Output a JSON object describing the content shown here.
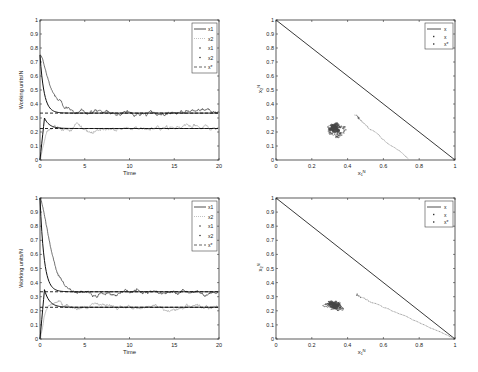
{
  "chart_data": [
    {
      "type": "line",
      "position": "top-left",
      "xlabel": "Time",
      "ylabel": "Working units/N",
      "xlim": [
        0,
        20
      ],
      "ylim": [
        0,
        1
      ],
      "xticks": [
        "0",
        "5",
        "10",
        "15",
        "20"
      ],
      "yticks": [
        "0",
        "0.1",
        "0.2",
        "0.3",
        "0.4",
        "0.5",
        "0.6",
        "0.7",
        "0.8",
        "0.9",
        "1"
      ],
      "legend": [
        "x1^N",
        "x2^N",
        "x1",
        "x2",
        "x*"
      ],
      "legend_position": "upper right",
      "series": [
        {
          "name": "x1 (deterministic)",
          "start": 0.75,
          "steady": 0.335
        },
        {
          "name": "x2 (deterministic)",
          "start": 0.0,
          "peak": 0.3,
          "steady": 0.225
        },
        {
          "name": "x* level 1",
          "value": 0.335
        },
        {
          "name": "x* level 2",
          "value": 0.225
        }
      ]
    },
    {
      "type": "scatter",
      "position": "top-right",
      "xlabel": "x1^N",
      "ylabel": "x2^N",
      "xlim": [
        0,
        1
      ],
      "ylim": [
        0,
        1
      ],
      "xticks": [
        "0",
        "0.2",
        "0.4",
        "0.6",
        "0.8",
        "1"
      ],
      "yticks": [
        "0",
        "0.1",
        "0.2",
        "0.3",
        "0.4",
        "0.5",
        "0.6",
        "0.7",
        "0.8",
        "0.9",
        "1"
      ],
      "legend": [
        "x^N",
        "x",
        "x*"
      ],
      "legend_position": "upper right",
      "boundary_line": [
        [
          0,
          1
        ],
        [
          1,
          0
        ]
      ],
      "trajectory_start": [
        0.75,
        0.0
      ],
      "cluster_center": [
        0.33,
        0.23
      ]
    },
    {
      "type": "line",
      "position": "bottom-left",
      "xlabel": "Time",
      "ylabel": "Working units/N",
      "xlim": [
        0,
        20
      ],
      "ylim": [
        0,
        1
      ],
      "xticks": [
        "0",
        "5",
        "10",
        "15",
        "20"
      ],
      "yticks": [
        "0",
        "0.1",
        "0.2",
        "0.3",
        "0.4",
        "0.5",
        "0.6",
        "0.7",
        "0.8",
        "0.9",
        "1"
      ],
      "legend": [
        "x1^N",
        "x2^N",
        "x1",
        "x2",
        "x*"
      ],
      "legend_position": "upper right",
      "series": [
        {
          "name": "x1 (deterministic)",
          "start": 1.0,
          "steady": 0.335
        },
        {
          "name": "x2 (deterministic)",
          "start": 0.0,
          "peak": 0.35,
          "steady": 0.225
        },
        {
          "name": "x* level 1",
          "value": 0.335
        },
        {
          "name": "x* level 2",
          "value": 0.225
        }
      ]
    },
    {
      "type": "scatter",
      "position": "bottom-right",
      "xlabel": "x1^N",
      "ylabel": "x2^N",
      "xlim": [
        0,
        1
      ],
      "ylim": [
        0,
        1
      ],
      "xticks": [
        "0",
        "0.2",
        "0.4",
        "0.6",
        "0.8",
        "1"
      ],
      "yticks": [
        "0",
        "0.1",
        "0.2",
        "0.3",
        "0.4",
        "0.5",
        "0.6",
        "0.7",
        "0.8",
        "0.9",
        "1"
      ],
      "legend": [
        "x^N",
        "x",
        "x*"
      ],
      "legend_position": "upper right",
      "boundary_line": [
        [
          0,
          1
        ],
        [
          1,
          0
        ]
      ],
      "trajectory_start": [
        1.0,
        0.0
      ],
      "cluster_center": [
        0.33,
        0.24
      ]
    }
  ],
  "labels": {
    "time": "Time",
    "ylabel": "Working units/N",
    "x1N": "x",
    "x2N": "x",
    "sup": "N",
    "sub1": "1",
    "sub2": "2",
    "star": "*"
  }
}
